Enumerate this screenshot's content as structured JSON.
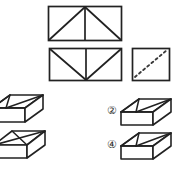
{
  "figure": {
    "stroke_color": "#222222",
    "background_color": "#ffffff",
    "dashed_color": "#3a3a3a"
  },
  "top_panel": {
    "shapes": [
      {
        "id": "rect-peak",
        "name": "rectangle-with-peak-fold",
        "kind": "rectangle",
        "description": "Rectangle with two lines rising from the bottom corners to an apex at the top edge center, plus a vertical line from the apex down to the bottom edge",
        "x": 48,
        "y": 6,
        "width": 74,
        "height": 35,
        "internal_lines": [
          "bottom-left-to-top-center",
          "bottom-right-to-top-center",
          "top-center-to-bottom-center"
        ]
      },
      {
        "id": "rect-valley",
        "name": "rectangle-with-valley-fold",
        "kind": "rectangle",
        "description": "Rectangle with two lines descending from the top corners to a vertex at the bottom edge center, plus a vertical line from the top edge center down to that vertex",
        "x": 49,
        "y": 48,
        "width": 73,
        "height": 33,
        "internal_lines": [
          "top-left-to-bottom-center",
          "top-right-to-bottom-center",
          "top-center-to-bottom-center"
        ]
      },
      {
        "id": "square-dashed-diagonal",
        "name": "square-with-dashed-diagonal",
        "kind": "square",
        "description": "Square with a dashed diagonal line running from the lower-left corner to the upper-right corner",
        "x": 132,
        "y": 48,
        "width": 38,
        "height": 33,
        "internal_lines": [
          "dashed-bottom-left-to-top-right"
        ]
      }
    ]
  },
  "bottom_panel": {
    "boxes": [
      {
        "id": "box-ref-1",
        "name": "reference-box-fan-pattern",
        "description": "3D parallelepiped box; top face shows a fan of three lines converging at a point on the front-lower edge",
        "x": -6,
        "y": 94,
        "width": 58,
        "height": 28,
        "label": ""
      },
      {
        "id": "box-ref-2",
        "name": "reference-box-x-pattern",
        "description": "3D parallelepiped box; top face shows both diagonals forming an X",
        "x": -4,
        "y": 130,
        "width": 56,
        "height": 28,
        "label": ""
      },
      {
        "id": "box-option-2",
        "name": "option-box-2",
        "description": "3D parallelepiped box option labelled 2; top face shows a fan of three lines converging at a point on the front-lower edge",
        "x": 122,
        "y": 98,
        "width": 53,
        "height": 27,
        "label": "②"
      },
      {
        "id": "box-option-4",
        "name": "option-box-4",
        "description": "3D parallelepiped box option labelled 4; top face shows a fan of three lines converging at a point on the front-lower edge",
        "x": 122,
        "y": 132,
        "width": 53,
        "height": 27,
        "label": "④"
      }
    ]
  },
  "option_labels": {
    "option_2": "②",
    "option_4": "④"
  },
  "accessible": {
    "caption": "Two rectangles with fold lines and a square with a dashed diagonal above four three-dimensional box figures, two of which are answer options numbered 2 and 4."
  }
}
